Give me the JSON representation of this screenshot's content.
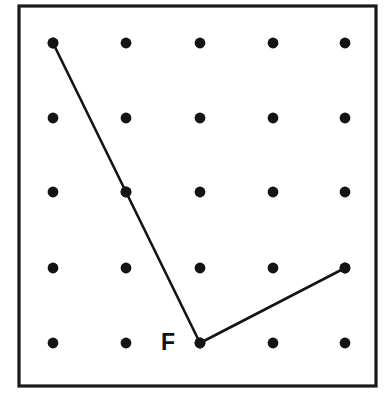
{
  "figure": {
    "type": "geoboard-diagram",
    "canvas": {
      "width": 384,
      "height": 402,
      "background": "#ffffff"
    },
    "frame": {
      "name": "geoboard-frame",
      "x": 19,
      "y": 6,
      "width": 357,
      "height": 380,
      "stroke_color": "#1a1a1a",
      "stroke_width": 3.2
    },
    "grid": {
      "columns": 5,
      "rows": 5,
      "column_x": [
        53,
        126,
        200,
        273,
        345
      ],
      "row_y": [
        43,
        118,
        192,
        268,
        343
      ],
      "dot_radius": 5.4,
      "dot_color": "#141414"
    },
    "path": {
      "name": "angle-path",
      "stroke_color": "#141414",
      "stroke_width": 2.6,
      "vertices": [
        {
          "id": "A",
          "col": 0,
          "row": 0,
          "x": 53,
          "y": 43
        },
        {
          "id": "B",
          "col": 1,
          "row": 2,
          "x": 126,
          "y": 192
        },
        {
          "id": "F",
          "col": 2,
          "row": 4,
          "x": 200,
          "y": 343
        },
        {
          "id": "C",
          "col": 4,
          "row": 3,
          "x": 345,
          "y": 268
        }
      ],
      "segments": [
        {
          "from": "A",
          "to": "F",
          "passes_through": "B"
        },
        {
          "from": "F",
          "to": "C"
        }
      ]
    },
    "labels": [
      {
        "name": "vertex-label-f",
        "text": "F",
        "x": 168,
        "y": 344,
        "font_size": 23,
        "font_weight": "bold",
        "color": "#111111"
      }
    ]
  }
}
